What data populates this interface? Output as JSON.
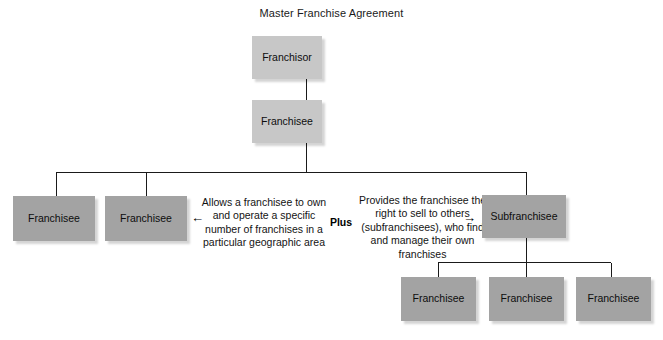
{
  "diagram": {
    "title": "Master Franchise Agreement",
    "nodes": {
      "franchisor": "Franchisor",
      "master_franchisee": "Franchisee",
      "left_franchisee_1": "Franchisee",
      "left_franchisee_2": "Franchisee",
      "subfranchisee": "Subfranchisee",
      "sub_franchisee_1": "Franchisee",
      "sub_franchisee_2": "Franchisee",
      "sub_franchisee_3": "Franchisee"
    },
    "annotations": {
      "left_description": "Allows a franchisee to own and operate a specific number of franchises in a particular geographic area",
      "connector_label": "Plus",
      "right_description": "Provides the franchisee the right to sell to others (subfranchisees), who find and manage their own franchises"
    },
    "icons": {
      "arrow_left": "←",
      "arrow_right": "→"
    },
    "colors": {
      "box_light": "#c7c7c7",
      "box_dark": "#a3a3a3",
      "line": "#1a1a1a",
      "text": "#111111",
      "background": "#ffffff"
    }
  }
}
